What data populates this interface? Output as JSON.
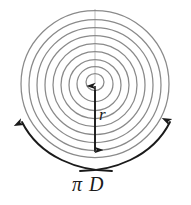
{
  "figure": {
    "background_color": "#ffffff",
    "ring_color": "#8a8a8a",
    "arrow_color": "#1a1a1a",
    "axis_color": "#b0b0b0",
    "labels": {
      "radius": "r",
      "circumference": "π D"
    },
    "geometry": {
      "center_x": 95,
      "center_y": 84,
      "outer_radius": 74,
      "ring_count": 9,
      "ring_radii": [
        74,
        66,
        58,
        50,
        42,
        34,
        26,
        18,
        9
      ],
      "radius_arrow_top_y": 84,
      "radius_arrow_bottom_y": 157
    },
    "rotation_arrows": [
      {
        "name": "left-rotation-arrow",
        "direction": "counterclockwise-up"
      },
      {
        "name": "right-rotation-arrow",
        "direction": "clockwise-up"
      }
    ]
  }
}
